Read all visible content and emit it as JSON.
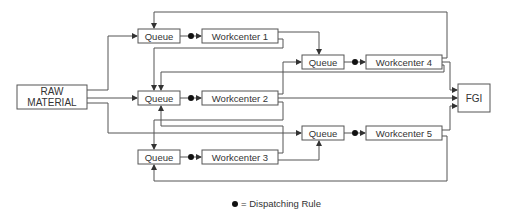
{
  "diagram": {
    "nodes": {
      "raw_material": {
        "line1": "RAW",
        "line2": "MATERIAL"
      },
      "fgi": {
        "label": "FGI"
      },
      "queue1": {
        "label": "Queue"
      },
      "queue2": {
        "label": "Queue"
      },
      "queue3": {
        "label": "Queue"
      },
      "queue4": {
        "label": "Queue"
      },
      "queue5": {
        "label": "Queue"
      },
      "workcenter1": {
        "label": "Workcenter 1"
      },
      "workcenter2": {
        "label": "Workcenter 2"
      },
      "workcenter3": {
        "label": "Workcenter 3"
      },
      "workcenter4": {
        "label": "Workcenter 4"
      },
      "workcenter5": {
        "label": "Workcenter 5"
      }
    },
    "legend": {
      "symbol": "dispatching-dot",
      "text": "= Dispatching Rule"
    },
    "colors": {
      "line": "#555555",
      "text": "#333333",
      "dot": "#111111"
    }
  }
}
